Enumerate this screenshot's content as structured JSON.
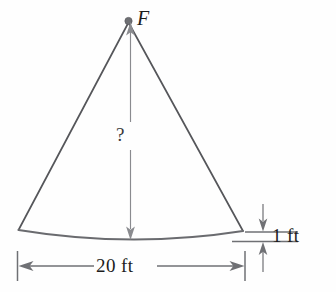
{
  "figure": {
    "background_color": "#fefefe",
    "stroke_color": "#55565a",
    "text_color": "#1c1c1c",
    "labels": {
      "apex_point": "F",
      "unknown_height": "?",
      "base_width": "20 ft",
      "sagitta": "1 ft"
    },
    "geometry": {
      "apex": {
        "x": 128,
        "y": 21
      },
      "left_base_vertex": {
        "x": 18,
        "y": 230
      },
      "right_base_vertex": {
        "x": 243,
        "y": 231
      },
      "arc_lowest_point": {
        "x": 131,
        "y": 239
      },
      "apex_dot_radius": 3.4
    },
    "dimensions": [
      {
        "name": "height-dimension",
        "label": "?",
        "orientation": "vertical",
        "from": {
          "x": 130,
          "y": 22
        },
        "to": {
          "x": 130,
          "y": 238
        }
      },
      {
        "name": "base-width-dimension",
        "label": "20 ft",
        "orientation": "horizontal",
        "from": {
          "x": 18,
          "y": 266
        },
        "to": {
          "x": 245,
          "y": 266
        }
      },
      {
        "name": "sagitta-dimension",
        "label": "1 ft",
        "orientation": "vertical",
        "from": {
          "x": 263,
          "y": 204
        },
        "to": {
          "x": 263,
          "y": 268
        }
      }
    ],
    "icons": {
      "apex_marker": "filled-dot-marker",
      "arrow": "arrowhead-marker",
      "tick": "extension-tick-marker"
    }
  }
}
